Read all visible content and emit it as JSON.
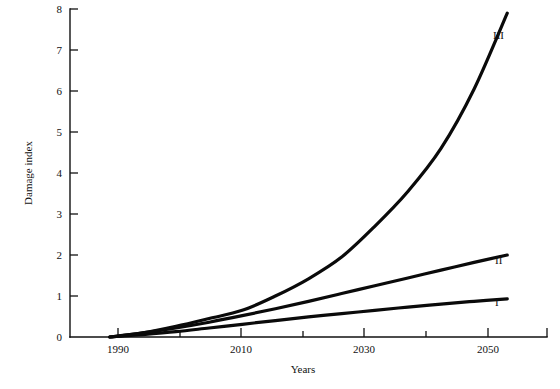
{
  "chart_data": {
    "type": "line",
    "title": "",
    "xlabel": "Years",
    "ylabel": "Damage index",
    "xlim": [
      1984,
      2056
    ],
    "ylim": [
      0,
      8
    ],
    "grid": false,
    "legend_position": "inline-right-of-curve-ends",
    "x_ticks_major": [
      1990,
      2010,
      2030,
      2050
    ],
    "x_ticks_major_labels": [
      "1990",
      "2010",
      "2030",
      "2050"
    ],
    "x_ticks_minor": [
      2000,
      2020,
      2040
    ],
    "y_ticks": [
      0,
      1,
      2,
      3,
      4,
      5,
      6,
      7,
      8
    ],
    "y_tick_labels": [
      "0",
      "1",
      "2",
      "3",
      "4",
      "5",
      "6",
      "7",
      "8"
    ],
    "x": [
      1990,
      1995,
      2000,
      2005,
      2010,
      2015,
      2020,
      2025,
      2030,
      2035,
      2040,
      2045,
      2050
    ],
    "series": [
      {
        "name": "I",
        "label": "I",
        "values": [
          0,
          0.06,
          0.13,
          0.22,
          0.31,
          0.4,
          0.49,
          0.57,
          0.65,
          0.73,
          0.8,
          0.87,
          0.93
        ]
      },
      {
        "name": "II",
        "label": "II",
        "values": [
          0,
          0.1,
          0.22,
          0.36,
          0.52,
          0.69,
          0.87,
          1.06,
          1.25,
          1.44,
          1.63,
          1.82,
          2.0
        ]
      },
      {
        "name": "III",
        "label": "III",
        "values": [
          0,
          0.1,
          0.26,
          0.45,
          0.65,
          1.0,
          1.42,
          1.95,
          2.7,
          3.55,
          4.6,
          6.05,
          7.9
        ]
      }
    ],
    "colors": {
      "axis": "#111111",
      "curve": "#0a0a0a",
      "background": "#ffffff"
    }
  }
}
